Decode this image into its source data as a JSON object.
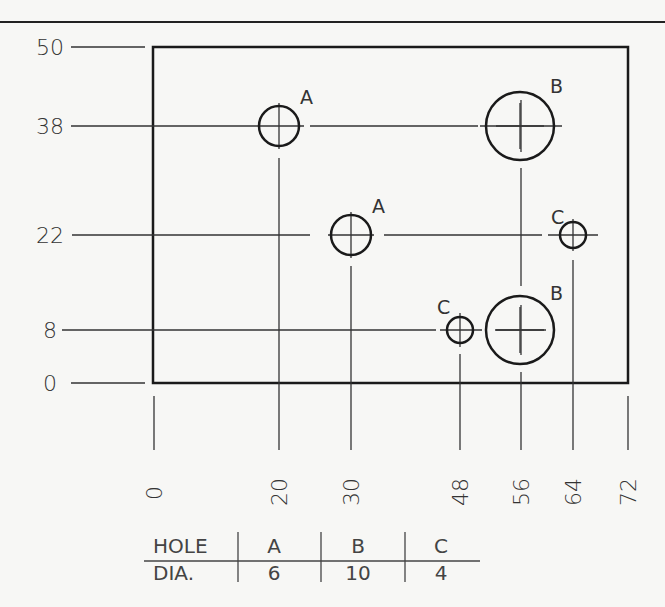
{
  "drawing": {
    "type": "hole-position-drawing",
    "units_note": "",
    "plate": {
      "x_min": 0,
      "x_max": 72,
      "y_min": 0,
      "y_max": 50
    },
    "y_dimensions": [
      "50",
      "38",
      "22",
      "8",
      "0"
    ],
    "x_dimensions": [
      "0",
      "20",
      "30",
      "48",
      "56",
      "64",
      "72"
    ],
    "holes": [
      {
        "label": "A",
        "x": 20,
        "y": 38,
        "dia": 6
      },
      {
        "label": "B",
        "x": 56,
        "y": 38,
        "dia": 10
      },
      {
        "label": "A",
        "x": 30,
        "y": 22,
        "dia": 6
      },
      {
        "label": "C",
        "x": 64,
        "y": 22,
        "dia": 4
      },
      {
        "label": "C",
        "x": 48,
        "y": 8,
        "dia": 4
      },
      {
        "label": "B",
        "x": 56,
        "y": 8,
        "dia": 10
      }
    ]
  },
  "hole_table": {
    "row_header_1": "HOLE",
    "row_header_2": "DIA.",
    "columns": [
      {
        "hole": "A",
        "dia": "6"
      },
      {
        "hole": "B",
        "dia": "10"
      },
      {
        "hole": "C",
        "dia": "4"
      }
    ]
  },
  "colors": {
    "line": "#1a1a1a",
    "thin_line": "#333333",
    "background": "#f7f7f5"
  }
}
